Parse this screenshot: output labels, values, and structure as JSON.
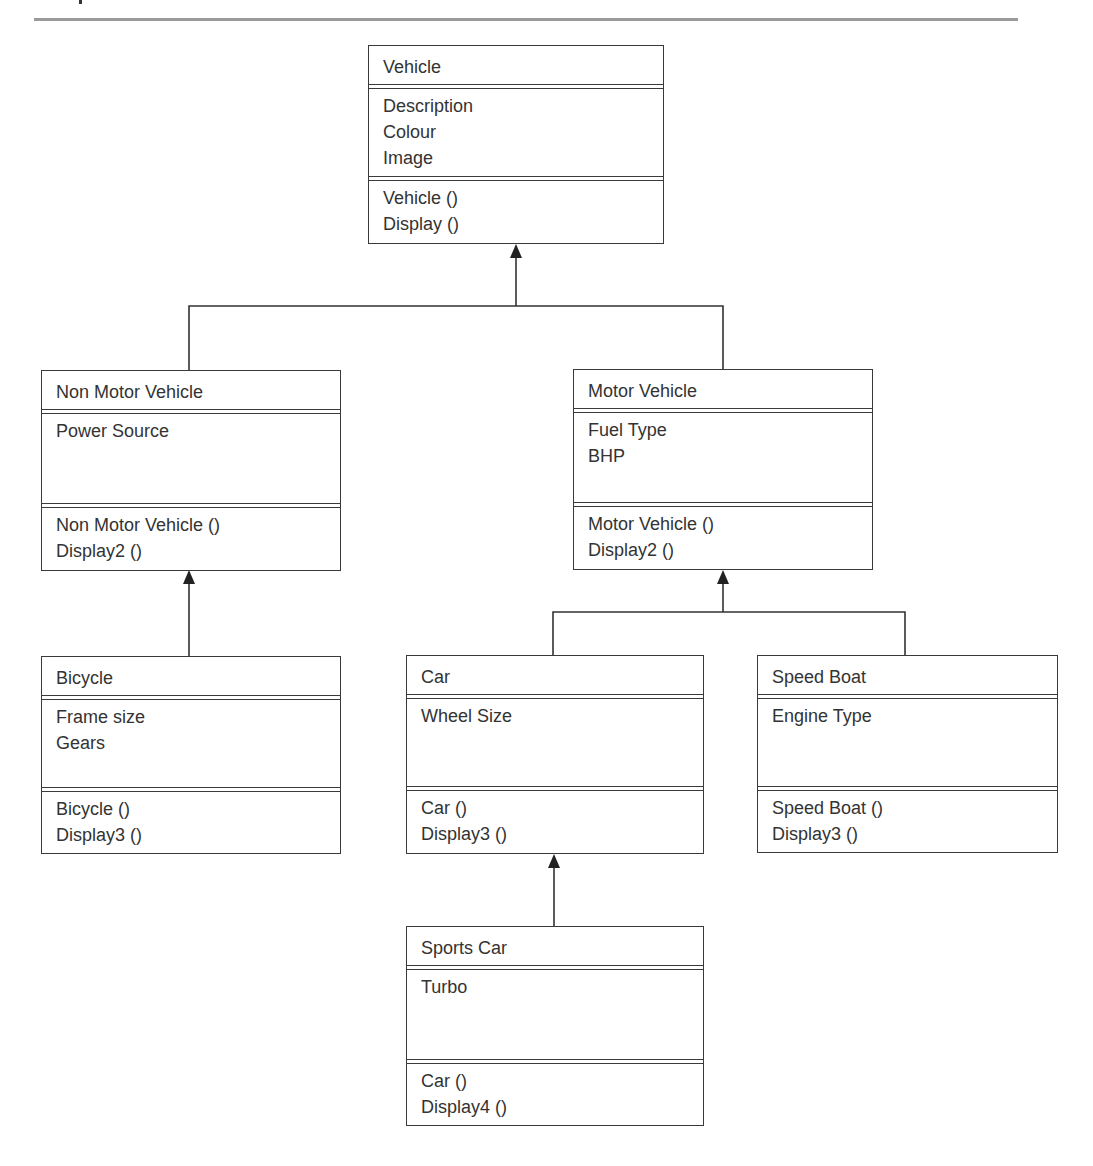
{
  "diagram": {
    "type": "UML class diagram",
    "classes": [
      {
        "id": "vehicle",
        "name": "Vehicle",
        "attributes": [
          "Description",
          "Colour",
          "Image"
        ],
        "operations": [
          "Vehicle ()",
          "Display ()"
        ]
      },
      {
        "id": "non-motor-vehicle",
        "name": "Non Motor Vehicle",
        "attributes": [
          "Power Source"
        ],
        "operations": [
          "Non Motor Vehicle ()",
          "Display2 ()"
        ]
      },
      {
        "id": "motor-vehicle",
        "name": "Motor Vehicle",
        "attributes": [
          "Fuel Type",
          "BHP"
        ],
        "operations": [
          "Motor Vehicle ()",
          "Display2 ()"
        ]
      },
      {
        "id": "bicycle",
        "name": "Bicycle",
        "attributes": [
          "Frame size",
          "Gears"
        ],
        "operations": [
          "Bicycle ()",
          "Display3 ()"
        ]
      },
      {
        "id": "car",
        "name": "Car",
        "attributes": [
          "Wheel Size"
        ],
        "operations": [
          "Car ()",
          "Display3 ()"
        ]
      },
      {
        "id": "speed-boat",
        "name": "Speed Boat",
        "attributes": [
          "Engine Type"
        ],
        "operations": [
          "Speed Boat ()",
          "Display3 ()"
        ]
      },
      {
        "id": "sports-car",
        "name": "Sports Car",
        "attributes": [
          "Turbo"
        ],
        "operations": [
          "Car ()",
          "Display4 ()"
        ]
      }
    ],
    "inheritance": [
      {
        "child": "non-motor-vehicle",
        "parent": "vehicle"
      },
      {
        "child": "motor-vehicle",
        "parent": "vehicle"
      },
      {
        "child": "bicycle",
        "parent": "non-motor-vehicle"
      },
      {
        "child": "car",
        "parent": "motor-vehicle"
      },
      {
        "child": "speed-boat",
        "parent": "motor-vehicle"
      },
      {
        "child": "sports-car",
        "parent": "car"
      }
    ]
  }
}
